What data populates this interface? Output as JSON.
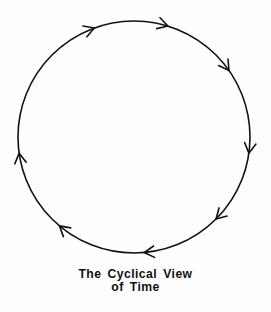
{
  "figure": {
    "name": "the-cyclical-view-of-time-diagram",
    "background_color": "#fefefe",
    "ink_color": "#111111"
  },
  "caption": {
    "line1": "The Cyclical View",
    "line2": "of Time",
    "full_text": "The Cyclical View of Time"
  },
  "chart_data": {
    "type": "diagram",
    "title": "The Cyclical View of Time",
    "shape": "circle",
    "direction": "clockwise",
    "stroke_color": "#111111",
    "stroke_width": 1.5,
    "fill": "none",
    "center": {
      "x": 134,
      "y": 137
    },
    "radius": 116,
    "arrowhead_count": 8,
    "arrowhead_angles_deg": [
      250,
      287,
      325,
      8,
      45,
      85,
      130,
      172
    ],
    "arrowheads": [
      {
        "label": "arrowhead-upper-left",
        "angle_deg": 250,
        "points": "up-right"
      },
      {
        "label": "arrowhead-top-left",
        "angle_deg": 287,
        "points": "right"
      },
      {
        "label": "arrowhead-top-right",
        "angle_deg": 325,
        "points": "right"
      },
      {
        "label": "arrowhead-right-upper",
        "angle_deg": 8,
        "points": "down-right"
      },
      {
        "label": "arrowhead-right-lower",
        "angle_deg": 45,
        "points": "down"
      },
      {
        "label": "arrowhead-bottom-right",
        "angle_deg": 85,
        "points": "down-left"
      },
      {
        "label": "arrowhead-bottom-left",
        "angle_deg": 130,
        "points": "left"
      },
      {
        "label": "arrowhead-left-lower",
        "angle_deg": 172,
        "points": "up-left"
      }
    ],
    "xlabel": "",
    "ylabel": "",
    "legend": [],
    "grid": false
  }
}
